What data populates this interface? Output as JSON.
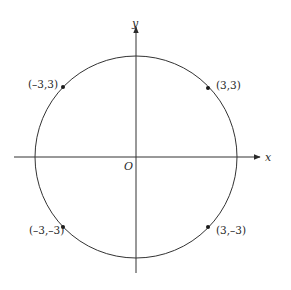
{
  "diagram": {
    "type": "coordinate-plane-circle",
    "axes": {
      "x_label": "x",
      "y_label": "y",
      "origin_label": "O"
    },
    "circle": {
      "center": [
        0,
        0
      ],
      "description": "circle centered at origin passing through the four labeled points"
    },
    "points": [
      {
        "label": "(–3,3)",
        "x": -3,
        "y": 3
      },
      {
        "label": "(3,3)",
        "x": 3,
        "y": 3
      },
      {
        "label": "(–3,–3)",
        "x": -3,
        "y": -3
      },
      {
        "label": "(3,–3)",
        "x": 3,
        "y": -3
      }
    ],
    "colors": {
      "stroke": "#333333",
      "background": "#ffffff"
    }
  }
}
